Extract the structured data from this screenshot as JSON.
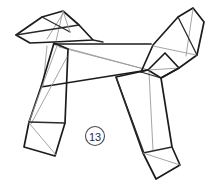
{
  "figure": {
    "background_color": "#ffffff",
    "outline_color": "#1c1c1e",
    "fold_line_color": "#9a9a9e",
    "step_badge": {
      "label": "13",
      "shape": "circle",
      "center_x": 95,
      "center_y": 136,
      "radius": 9
    },
    "parts": [
      {
        "name": "head",
        "label": "Head"
      },
      {
        "name": "snout",
        "label": "Snout"
      },
      {
        "name": "ear",
        "label": "Ear"
      },
      {
        "name": "neck",
        "label": "Neck"
      },
      {
        "name": "body",
        "label": "Body"
      },
      {
        "name": "back",
        "label": "Back"
      },
      {
        "name": "belly",
        "label": "Belly"
      },
      {
        "name": "front-leg",
        "label": "Front leg"
      },
      {
        "name": "front-foot",
        "label": "Front foot"
      },
      {
        "name": "hind-leg",
        "label": "Hind leg"
      },
      {
        "name": "hind-foot",
        "label": "Hind foot"
      },
      {
        "name": "haunch",
        "label": "Haunch"
      },
      {
        "name": "tail",
        "label": "Tail"
      }
    ],
    "geometry": {
      "head_outline": "M 16,35 L 42,17 L 63,11 L 78,25 L 92,39 L 54,41 L 30,42 Z",
      "head_fold_a": "M 63,11 L 54,41",
      "head_fold_b": "M 63,11 L 42,38",
      "head_fold_c": "M 42,17 L 66,35",
      "head_fold_d": "M 16,35 L 78,25",
      "ear_outline": "M 78,25 L 92,39 L 100,42",
      "neck_outline": "M 54,41 L 54,45",
      "body_back": "M 54,44 L 151,44",
      "body_belly": "M 41,87 L 148,70",
      "body_left_edge": "M 54,44 L 41,87",
      "body_fold_diag": "M 60,48 L 148,70",
      "body_fold_mid": "M 42,62 L 148,70",
      "chest_fold": "M 47,46 L 43,86",
      "front_leg_outline": "M 54,44 L 68,49 L 66,122 L 55,155 L 24,147 L 29,123 L 41,87 Z",
      "front_leg_fold_a": "M 58,47 L 29,123",
      "front_leg_fold_b": "M 67,56 L 30,124",
      "front_foot_outline": "M 29,123 L 24,147 L 55,155 L 66,122 Z",
      "front_foot_fold": "M 29,123 L 55,155",
      "hind_leg_outline": "M 148,70 L 160,77 L 172,146 L 180,165 L 155,178 L 143,152 L 116,76 Z",
      "hind_leg_fold_a": "M 148,70 L 152,148",
      "hind_leg_fold_b": "M 116,76 L 143,152",
      "hind_foot_outline": "M 143,152 L 155,178 L 180,165 L 172,146 Z",
      "hind_foot_fold": "M 143,152 L 180,165",
      "haunch_outline": "M 148,70 L 163,52 L 178,68 L 160,77 Z",
      "haunch_fold": "M 148,70 L 178,68",
      "tail_outline": "M 143,72 L 152,45 L 178,17 L 193,8 L 203,22 L 196,54 L 178,68 L 160,77 Z",
      "tail_fold_a": "M 193,8 L 185,55",
      "tail_fold_b": "M 152,45 L 196,54",
      "tail_inner": "M 178,17 L 196,54"
    }
  }
}
